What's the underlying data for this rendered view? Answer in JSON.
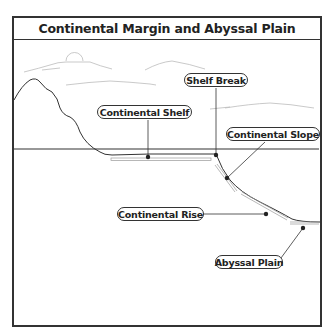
{
  "title": "Continental Margin and Abyssal Plain",
  "labels": {
    "continental_shelf": "Continental Shelf",
    "shelf_break": "Shelf Break",
    "continental_slope": "Continental Slope",
    "continental_rise": "Continental Rise",
    "abyssal_plain": "Abyssal Plain"
  },
  "colors": {
    "line": "#333333",
    "sky_sketch": "#bbbbbb",
    "background": "#ffffff"
  }
}
